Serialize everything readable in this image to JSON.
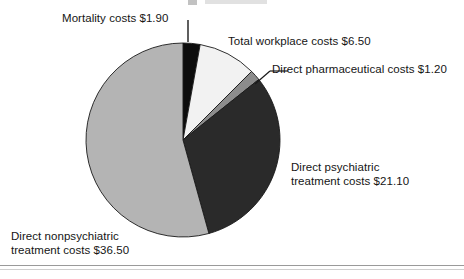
{
  "figure": {
    "background_color": "#ffffff",
    "has_bottom_rule": true
  },
  "chart_data": {
    "type": "pie",
    "title": "",
    "subtitle": "",
    "xlabel": "",
    "ylabel": "",
    "units": "USD billions",
    "total": 67.2,
    "legend_position": "callout-labels",
    "grid": false,
    "center": {
      "x": 183,
      "y": 140
    },
    "radius": 97,
    "start_angle_deg": 0,
    "direction": "clockwise",
    "categories": [
      "Mortality costs",
      "Total workplace costs",
      "Direct pharmaceutical costs",
      "Direct psychiatric treatment costs",
      "Direct nonpsychiatric treatment costs"
    ],
    "values": [
      1.9,
      6.5,
      1.2,
      21.1,
      36.5
    ],
    "value_labels": [
      "$1.90",
      "$6.50",
      "$1.20",
      "$21.10",
      "$36.50"
    ],
    "colors": [
      "#0d0d0d",
      "#f2f2f2",
      "#8c8c8c",
      "#2a2a2a",
      "#b4b4b4"
    ],
    "slices": [
      {
        "label": "Mortality costs $1.90",
        "name": "Mortality costs",
        "value": 1.9,
        "value_label": "$1.90",
        "percent": 2.8,
        "color": "#0d0d0d",
        "start_deg": 0.0,
        "end_deg": 10.2
      },
      {
        "label": "Total workplace costs $6.50",
        "name": "Total workplace costs",
        "value": 6.5,
        "value_label": "$6.50",
        "percent": 9.7,
        "color": "#f2f2f2",
        "start_deg": 10.2,
        "end_deg": 45.0
      },
      {
        "label": "Direct pharmaceutical costs $1.20",
        "name": "Direct pharmaceutical costs",
        "value": 1.2,
        "value_label": "$1.20",
        "percent": 1.8,
        "color": "#8c8c8c",
        "start_deg": 45.0,
        "end_deg": 51.4
      },
      {
        "label": "Direct psychiatric\ntreatment costs $21.10",
        "name": "Direct psychiatric treatment costs",
        "value": 21.1,
        "value_label": "$21.10",
        "percent": 31.4,
        "color": "#2a2a2a",
        "start_deg": 51.4,
        "end_deg": 164.5
      },
      {
        "label": "Direct nonpsychiatric\ntreatment costs $36.50",
        "name": "Direct nonpsychiatric treatment costs",
        "value": 36.5,
        "value_label": "$36.50",
        "percent": 54.3,
        "color": "#b4b4b4",
        "start_deg": 164.5,
        "end_deg": 360.0
      }
    ]
  },
  "labels": {
    "mortality": "Mortality costs $1.90",
    "workplace": "Total workplace costs $6.50",
    "pharmaceutical": "Direct pharmaceutical costs $1.20",
    "psychiatric": "Direct psychiatric\ntreatment costs $21.10",
    "nonpsychiatric": "Direct nonpsychiatric\ntreatment costs $36.50"
  }
}
